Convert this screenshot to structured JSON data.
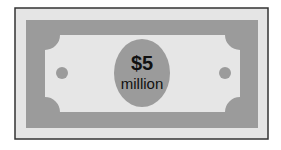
{
  "banknote": {
    "amount": "$5",
    "unit": "million",
    "colors": {
      "background": "#ffffff",
      "outer_fill": "#e5e5e5",
      "outer_border": "#333333",
      "band_fill": "#9b9b9b",
      "panel_fill": "#e6e6e6",
      "medallion_fill": "#9b9b9b",
      "dot_fill": "#9b9b9b",
      "text": "#111111"
    }
  }
}
